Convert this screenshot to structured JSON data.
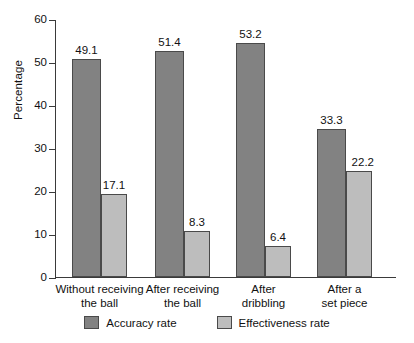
{
  "chart_data": {
    "type": "bar",
    "title": "",
    "xlabel": "",
    "ylabel": "Percentage",
    "ylim": [
      0,
      60
    ],
    "yticks": [
      0,
      10,
      20,
      30,
      40,
      50,
      60
    ],
    "grid": false,
    "legend_position": "bottom",
    "categories": [
      "Without receiving the ball",
      "After receiving the ball",
      "After dribbling",
      "After a set piece"
    ],
    "category_lines": [
      [
        "Without receiving",
        "the ball"
      ],
      [
        "After receiving",
        "the ball"
      ],
      [
        "After",
        "dribbling"
      ],
      [
        "After a",
        "set piece"
      ]
    ],
    "series": [
      {
        "name": "Accuracy rate",
        "color": "#828282",
        "values": [
          49.1,
          51.4,
          53.2,
          33.3
        ],
        "labels": [
          "49.1",
          "51.4",
          "53.2",
          "33.3"
        ],
        "plotted_heights": [
          50.6,
          52.6,
          54.4,
          34.4
        ]
      },
      {
        "name": "Effectiveness rate",
        "color": "#bdbdbd",
        "values": [
          17.1,
          8.3,
          6.4,
          22.2
        ],
        "labels": [
          "17.1",
          "8.3",
          "6.4",
          "22.2"
        ],
        "plotted_heights": [
          19.3,
          10.7,
          7.2,
          24.7
        ]
      }
    ]
  },
  "legend": {
    "items": [
      {
        "label": "Accuracy rate",
        "swatch": "dark"
      },
      {
        "label": "Effectiveness rate",
        "swatch": "light"
      }
    ]
  },
  "axis": {
    "y_title": "Percentage",
    "y_tick_labels": [
      "60",
      "50",
      "40",
      "30",
      "20",
      "10",
      "0"
    ]
  },
  "caption": "",
  "colors": {
    "accuracy": "#828282",
    "effectiveness": "#bdbdbd",
    "axis": "#3a3a3a",
    "bar_border": "#4a4a4a",
    "background": "#ffffff"
  }
}
